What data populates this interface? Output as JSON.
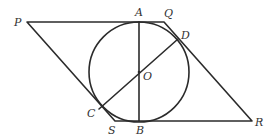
{
  "diagram": {
    "type": "geometry",
    "stroke_color": "#2b2b2b",
    "label_color": "#333333",
    "circle": {
      "center": "O",
      "cx": 139,
      "cy": 72,
      "r": 50
    },
    "points": {
      "P": {
        "x": 27,
        "y": 22
      },
      "A": {
        "x": 139,
        "y": 22
      },
      "Q": {
        "x": 164,
        "y": 22
      },
      "D": {
        "x": 178,
        "y": 39
      },
      "R": {
        "x": 252,
        "y": 121
      },
      "B": {
        "x": 139,
        "y": 121
      },
      "S": {
        "x": 115,
        "y": 121
      },
      "C": {
        "x": 99,
        "y": 109
      },
      "O": {
        "x": 139,
        "y": 72
      }
    },
    "labels": {
      "P": "P",
      "A": "A",
      "Q": "Q",
      "D": "D",
      "O": "O",
      "C": "C",
      "S": "S",
      "B": "B",
      "R": "R"
    },
    "segments": [
      [
        "P",
        "Q"
      ],
      [
        "Q",
        "R"
      ],
      [
        "R",
        "S"
      ],
      [
        "S",
        "P"
      ],
      [
        "A",
        "B"
      ],
      [
        "C",
        "D"
      ]
    ]
  }
}
